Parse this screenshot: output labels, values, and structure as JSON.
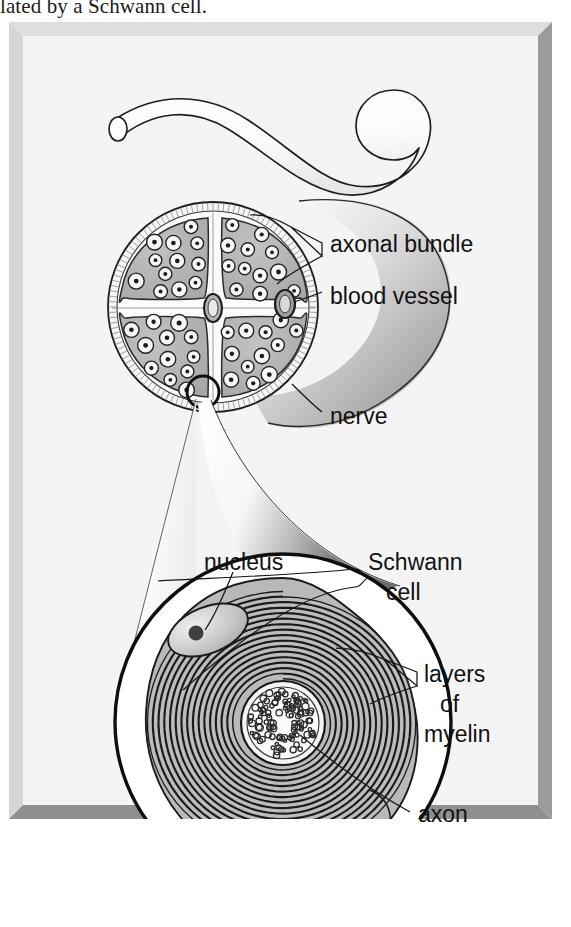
{
  "page": {
    "width": 571,
    "height": 927,
    "background": "#ffffff"
  },
  "caption": {
    "truncated_line": "lated by a Schwann cell."
  },
  "figure": {
    "frame": {
      "fill": "#f1f1f1",
      "bevel_light": "#e4e4e4",
      "bevel_dark": "#9d9d9d",
      "edge": "#c8c8c8",
      "x": 9,
      "y": 22,
      "width": 543,
      "height": 797
    },
    "panels": [
      {
        "name": "nerve-trunk",
        "description": "Cut length of peripheral nerve curving across the upper field with an open elliptical cut end at the left"
      },
      {
        "name": "nerve-cross-section",
        "description": "Transverse section of nerve showing four axonal bundles (fascicles) separated by connective tissue, surrounded by epineurium, containing blood vessels"
      },
      {
        "name": "schwann-cell-magnification",
        "description": "Circular magnified inset of one myelinated axon, showing the Schwann cell spiralling concentric layers of myelin around the central axon"
      }
    ],
    "labels": [
      {
        "id": "axonal-bundle",
        "text": "axonal bundle",
        "x": 330,
        "y": 245,
        "anchor": "start",
        "pointer": "double-arrow"
      },
      {
        "id": "blood-vessel",
        "text": "blood vessel",
        "x": 330,
        "y": 297,
        "anchor": "start",
        "pointer": "line"
      },
      {
        "id": "nerve",
        "text": "nerve",
        "x": 330,
        "y": 418,
        "anchor": "start",
        "pointer": "line"
      },
      {
        "id": "nucleus",
        "text": "nucleus",
        "x": 205,
        "y": 561,
        "anchor": "start",
        "pointer": "line"
      },
      {
        "id": "schwann-cell",
        "text": "Schwann",
        "text2": "cell",
        "x": 370,
        "y": 560,
        "anchor": "start",
        "pointer": "brace"
      },
      {
        "id": "layers-of-myelin",
        "text": "layers",
        "text2": "of",
        "text3": "myelin",
        "x": 425,
        "y": 680,
        "anchor": "start",
        "pointer": "double-arrow"
      },
      {
        "id": "axon",
        "text": "axon",
        "x": 417,
        "y": 815,
        "anchor": "start",
        "pointer": "line"
      }
    ],
    "colors": {
      "ink": "#141414",
      "paper": "#ffffff",
      "fascicle_fill": "#b0b0b0",
      "fascicle_fill_light": "#c2c2c2",
      "sheath_fill": "#f4f4f4",
      "myelin_band": "#b8b8b8",
      "cytoplasm": "#b5b5b5",
      "nucleus_fill": "#d0d0d0",
      "nucleolus": "#4a4a4a",
      "axoplasm": "#f0f0f0",
      "cone_light": "#fdfdfd",
      "cone_dark": "#6d6d6d",
      "label_text": "#121212"
    },
    "counts": {
      "fascicles": 4,
      "blood_vessels": 2,
      "myelin_layer_turns": 15
    }
  }
}
